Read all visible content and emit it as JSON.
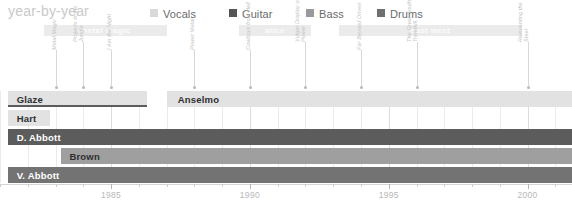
{
  "header": {
    "title": "year-by-year"
  },
  "legend": {
    "items": [
      {
        "label": "Vocals",
        "color": "#d9d9d9",
        "x": 150
      },
      {
        "label": "Guitar",
        "color": "#555555",
        "x": 229
      },
      {
        "label": "Bass",
        "color": "#9a9a9a",
        "x": 306
      },
      {
        "label": "Drums",
        "color": "#6f6f6f",
        "x": 377
      }
    ]
  },
  "chart_data": {
    "type": "bar",
    "title": "year-by-year",
    "xlabel": "",
    "ylabel": "",
    "xlim": [
      1981.0,
      2001.6
    ],
    "grid": true,
    "legend_position": "top-right",
    "xticks": [
      1985,
      1990,
      1995,
      2000
    ],
    "xtick_labels": [
      "1985",
      "1990",
      "1995",
      "2000"
    ],
    "minor_tick_interval": 1,
    "eras": [
      {
        "label": "metal magic",
        "start": 1982.6,
        "end": 1987.0,
        "color": "#ebebeb"
      },
      {
        "label": "alice",
        "start": 1989.6,
        "end": 1992.2,
        "color": "#ebebeb"
      },
      {
        "label": "east west",
        "start": 1993.2,
        "end": 1999.8,
        "color": "#ebebeb"
      }
    ],
    "albums": [
      {
        "title": "Metal Magic",
        "year": 1983.0,
        "stem": 38
      },
      {
        "title": "Projects in the Jungle",
        "year": 1984.0,
        "stem": 46
      },
      {
        "title": "I Am the Night",
        "year": 1985.0,
        "stem": 38
      },
      {
        "title": "Power Metal",
        "year": 1988.0,
        "stem": 38
      },
      {
        "title": "Cowboys from Hell",
        "year": 1990.0,
        "stem": 38
      },
      {
        "title": "Vulgar Display of Power",
        "year": 1992.0,
        "stem": 46
      },
      {
        "title": "Far Beyond Driven",
        "year": 1994.0,
        "stem": 38
      },
      {
        "title": "The Great Southern Trendkill",
        "year": 1996.0,
        "stem": 46
      },
      {
        "title": "Reinventing the Steel",
        "year": 2000.0,
        "stem": 46
      }
    ],
    "categories": [
      "Glaze",
      "Hart",
      "D. Abbott",
      "Brown",
      "V. Abbott"
    ],
    "series": [
      {
        "name": "Vocals",
        "role": "Vocals",
        "color": "#e2e2e2",
        "bars": [
          {
            "member": "Glaze",
            "start": 1981.3,
            "end": 1986.3,
            "lane": 0,
            "label_color": "#2f2f2f"
          },
          {
            "member": "Anselmo",
            "start": 1987.0,
            "end": 2001.6,
            "lane": 0,
            "label_color": "#2f2f2f"
          },
          {
            "member": "Hart",
            "start": 1981.3,
            "end": 1982.8,
            "lane": 1,
            "label_color": "#2f2f2f"
          }
        ]
      },
      {
        "name": "Guitar",
        "role": "Guitar",
        "color": "#5c5c5c",
        "bars": [
          {
            "member": "Glaze-guitar",
            "start": 1981.3,
            "end": 1986.3,
            "lane": 0,
            "underline": true
          },
          {
            "member": "D. Abbott",
            "start": 1981.3,
            "end": 2001.6,
            "lane": 2,
            "label_color": "#ffffff"
          }
        ]
      },
      {
        "name": "Bass",
        "role": "Bass",
        "color": "#9f9f9f",
        "bars": [
          {
            "member": "Brown",
            "start": 1983.2,
            "end": 2001.6,
            "lane": 3,
            "label_color": "#2f2f2f"
          }
        ]
      },
      {
        "name": "Drums",
        "role": "Drums",
        "color": "#737373",
        "bars": [
          {
            "member": "V. Abbott",
            "start": 1981.3,
            "end": 2001.6,
            "lane": 4,
            "label_color": "#ffffff"
          }
        ]
      }
    ],
    "row_labels": [
      {
        "text": "Glaze",
        "lane": 0,
        "x": 1981.6,
        "tone": "dark"
      },
      {
        "text": "Anselmo",
        "lane": 0,
        "x": 1987.4,
        "tone": "dark"
      },
      {
        "text": "Hart",
        "lane": 1,
        "x": 1981.6,
        "tone": "dark"
      },
      {
        "text": "D. Abbott",
        "lane": 2,
        "x": 1981.6,
        "tone": "light"
      },
      {
        "text": "Brown",
        "lane": 3,
        "x": 1983.5,
        "tone": "dark"
      },
      {
        "text": "V. Abbott",
        "lane": 4,
        "x": 1981.6,
        "tone": "light"
      }
    ]
  }
}
